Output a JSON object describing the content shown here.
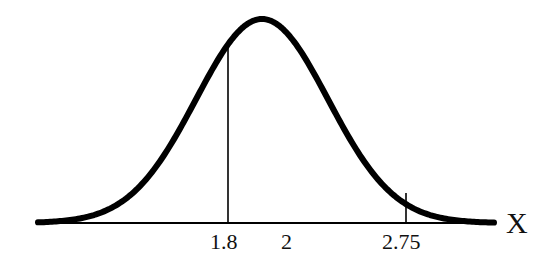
{
  "chart_data": {
    "type": "line",
    "title": "",
    "xlabel": "X",
    "ylabel": "",
    "x_tick_labels": [
      "1.8",
      "2",
      "2.75"
    ],
    "markers": [
      {
        "x": 1.8,
        "label": "1.8",
        "vertical_line": true
      },
      {
        "x": 2,
        "label": "2",
        "vertical_line": false
      },
      {
        "x": 2.75,
        "label": "2.75",
        "vertical_line": true
      }
    ],
    "grid": false,
    "legend": null,
    "curve": "bell-shaped normal density"
  },
  "labels": {
    "tick_1": "1.8",
    "tick_2": "2",
    "tick_3": "2.75",
    "axis": "X"
  },
  "colors": {
    "curve": "#000000",
    "axis": "#000000",
    "background": "#ffffff"
  }
}
